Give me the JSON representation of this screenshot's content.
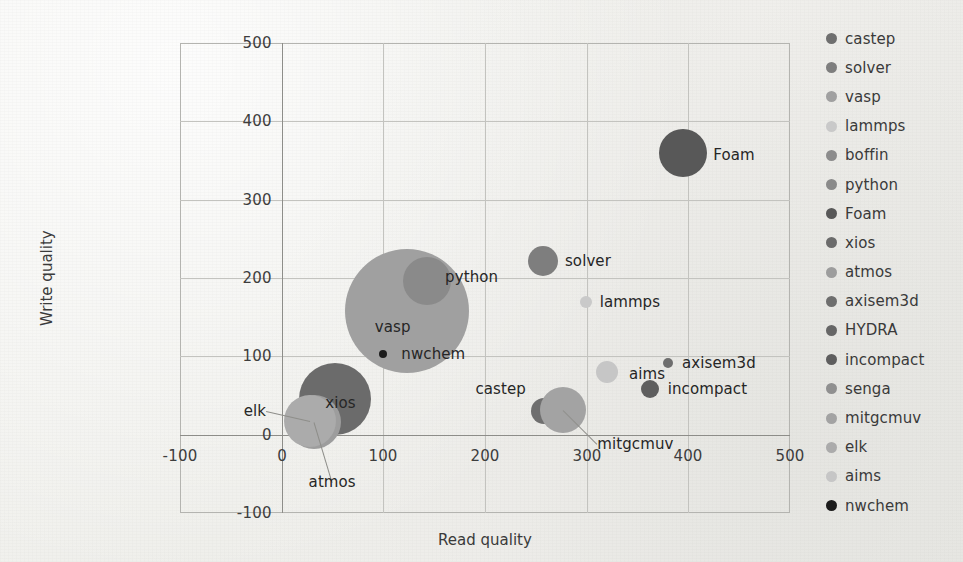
{
  "chart_data": {
    "type": "scatter",
    "title": "",
    "xlabel": "Read  quality",
    "ylabel": "Write quality",
    "xlim": [
      -100,
      500
    ],
    "ylim": [
      -100,
      500
    ],
    "xticks": [
      -100,
      0,
      100,
      200,
      300,
      400,
      500
    ],
    "yticks": [
      -100,
      0,
      100,
      200,
      300,
      400,
      500
    ],
    "xtick_labels": [
      "-100",
      "0",
      "100",
      "200",
      "300",
      "400",
      "500"
    ],
    "ytick_labels": [
      "-100",
      "0",
      "100",
      "200",
      "300",
      "400",
      "500"
    ],
    "grid": true,
    "legend_position": "right",
    "points": [
      {
        "name": "castep",
        "x": 258,
        "y": 30,
        "r": 13,
        "color": "#6f6f6f",
        "label": "castep",
        "label_pos": "left",
        "label_dx": -18,
        "label_dy": -22,
        "leader": false
      },
      {
        "name": "solver",
        "x": 257,
        "y": 222,
        "r": 15,
        "color": "#7e7e7e",
        "label": "solver",
        "label_pos": "right",
        "label_dx": 22,
        "label_dy": 0,
        "leader": false
      },
      {
        "name": "vasp",
        "x": 123,
        "y": 158,
        "r": 62,
        "color": "#a0a0a0",
        "label": "vasp",
        "label_pos": "center",
        "label_dx": -14,
        "label_dy": 16,
        "leader": false
      },
      {
        "name": "lammps",
        "x": 299,
        "y": 170,
        "r": 6,
        "color": "#c9c9c9",
        "label": "lammps",
        "label_pos": "right",
        "label_dx": 14,
        "label_dy": 0,
        "leader": false
      },
      {
        "name": "boffin",
        "x": 0,
        "y": 0,
        "r": 0,
        "color": "#8c8c8c",
        "label": "",
        "label_pos": "right",
        "label_dx": 0,
        "label_dy": 0,
        "leader": false
      },
      {
        "name": "python",
        "x": 143,
        "y": 196,
        "r": 24,
        "color": "#8a8a8a",
        "label": "python",
        "label_pos": "right",
        "label_dx": 18,
        "label_dy": -4,
        "leader": false
      },
      {
        "name": "Foam",
        "x": 395,
        "y": 360,
        "r": 24,
        "color": "#585858",
        "label": "Foam",
        "label_pos": "right",
        "label_dx": 30,
        "label_dy": 2,
        "leader": false
      },
      {
        "name": "xios",
        "x": 52,
        "y": 45,
        "r": 36,
        "color": "#6b6b6b",
        "label": "xios",
        "label_pos": "center",
        "label_dx": 6,
        "label_dy": 4,
        "leader": false
      },
      {
        "name": "atmos",
        "x": 32,
        "y": 16,
        "r": 27,
        "color": "#9d9d9d",
        "label": "atmos",
        "label_pos": "center",
        "label_dx": 18,
        "label_dy": 60,
        "leader": true
      },
      {
        "name": "axisem3d",
        "x": 380,
        "y": 92,
        "r": 5,
        "color": "#6e6e6e",
        "label": "axisem3d",
        "label_pos": "right",
        "label_dx": 14,
        "label_dy": 0,
        "leader": false
      },
      {
        "name": "HYDRA",
        "x": 0,
        "y": 0,
        "r": 0,
        "color": "#666666",
        "label": "",
        "label_pos": "right",
        "label_dx": 0,
        "label_dy": 0,
        "leader": false
      },
      {
        "name": "incompact",
        "x": 362,
        "y": 58,
        "r": 9,
        "color": "#5e5e5e",
        "label": "incompact",
        "label_pos": "right",
        "label_dx": 18,
        "label_dy": 0,
        "leader": false
      },
      {
        "name": "senga",
        "x": 0,
        "y": 0,
        "r": 0,
        "color": "#909090",
        "label": "",
        "label_pos": "right",
        "label_dx": 0,
        "label_dy": 0,
        "leader": false
      },
      {
        "name": "mitgcmuv",
        "x": 277,
        "y": 32,
        "r": 23,
        "color": "#a3a3a3",
        "label": "mitgcmuv",
        "label_pos": "right",
        "label_dx": 34,
        "label_dy": 34,
        "leader": true
      },
      {
        "name": "elk",
        "x": 28,
        "y": 18,
        "r": 26,
        "color": "#ababab",
        "label": "elk",
        "label_pos": "left",
        "label_dx": -44,
        "label_dy": -10,
        "leader": true
      },
      {
        "name": "aims",
        "x": 320,
        "y": 80,
        "r": 11,
        "color": "#c6c6c6",
        "label": "aims",
        "label_pos": "right",
        "label_dx": 22,
        "label_dy": 2,
        "leader": false
      },
      {
        "name": "nwchem",
        "x": 100,
        "y": 103,
        "r": 4,
        "color": "#1c1c1c",
        "label": "nwchem",
        "label_pos": "right",
        "label_dx": 18,
        "label_dy": 0,
        "leader": false
      }
    ],
    "legend": [
      {
        "label": "castep",
        "color": "#6f6f6f"
      },
      {
        "label": "solver",
        "color": "#7e7e7e"
      },
      {
        "label": "vasp",
        "color": "#a0a0a0"
      },
      {
        "label": "lammps",
        "color": "#c9c9c9"
      },
      {
        "label": "boffin",
        "color": "#8c8c8c"
      },
      {
        "label": "python",
        "color": "#8a8a8a"
      },
      {
        "label": "Foam",
        "color": "#585858"
      },
      {
        "label": "xios",
        "color": "#6b6b6b"
      },
      {
        "label": "atmos",
        "color": "#9d9d9d"
      },
      {
        "label": "axisem3d",
        "color": "#6e6e6e"
      },
      {
        "label": "HYDRA",
        "color": "#666666"
      },
      {
        "label": "incompact",
        "color": "#5e5e5e"
      },
      {
        "label": "senga",
        "color": "#909090"
      },
      {
        "label": "mitgcmuv",
        "color": "#a3a3a3"
      },
      {
        "label": "elk",
        "color": "#ababab"
      },
      {
        "label": "aims",
        "color": "#c6c6c6"
      },
      {
        "label": "nwchem",
        "color": "#1c1c1c"
      }
    ]
  },
  "geometry": {
    "plot_left": 180,
    "plot_right": 790,
    "plot_top": 43,
    "plot_bottom": 513
  }
}
